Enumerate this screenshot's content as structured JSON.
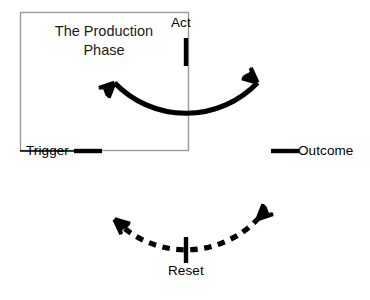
{
  "diagram": {
    "title": "The Production Phase",
    "title_line_1": "The Production",
    "title_line_2": "Phase",
    "type": "cycle-diagram",
    "background_color": "#ffffff",
    "stroke_color": "#000000",
    "box_stroke_color": "#9a9a9a",
    "nodes": [
      {
        "id": "act",
        "label": "Act",
        "angle_deg": 270,
        "position": "top",
        "tick": "vertical"
      },
      {
        "id": "outcome",
        "label": "Outcome",
        "angle_deg": 0,
        "position": "right",
        "tick": "horizontal"
      },
      {
        "id": "reset",
        "label": "Reset",
        "angle_deg": 90,
        "position": "bottom",
        "tick": "vertical"
      },
      {
        "id": "trigger",
        "label": "Trigger",
        "angle_deg": 180,
        "position": "left",
        "tick": "horizontal"
      }
    ],
    "arcs": [
      {
        "id": "act-to-outcome",
        "from": "act",
        "to": "outcome",
        "style": "solid",
        "direction": "clockwise"
      },
      {
        "id": "outcome-to-reset",
        "from": "outcome",
        "to": "reset",
        "style": "solid-to-dashed",
        "direction": "clockwise"
      },
      {
        "id": "reset-to-trigger",
        "from": "reset",
        "to": "trigger",
        "style": "dashed",
        "direction": "clockwise"
      },
      {
        "id": "trigger-to-act",
        "from": "trigger",
        "to": "act",
        "style": "solid",
        "direction": "clockwise"
      }
    ],
    "arrows": [
      {
        "id": "arrow-upper-left",
        "points_to": "act",
        "angle_deg": 222
      },
      {
        "id": "arrow-upper-right",
        "points_to": "outcome",
        "angle_deg": 318
      },
      {
        "id": "arrow-lower-right",
        "points_to": "reset",
        "angle_deg": 42
      },
      {
        "id": "arrow-lower-left",
        "points_to": "trigger",
        "angle_deg": 138
      }
    ]
  }
}
